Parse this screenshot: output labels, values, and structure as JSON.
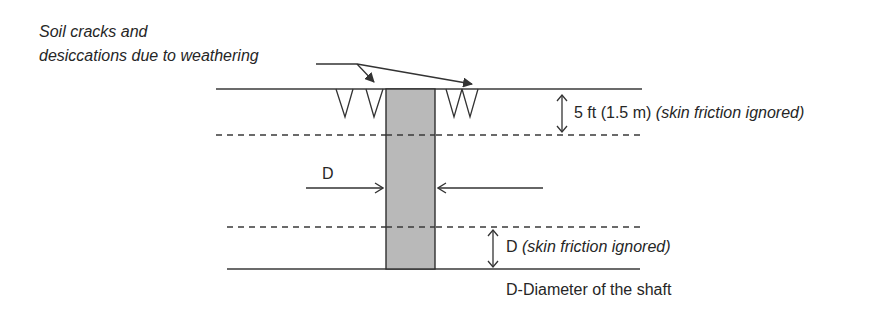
{
  "diagram": {
    "callout": {
      "line1": "Soil cracks and",
      "line2": "desiccations due to weathering"
    },
    "top_zone": {
      "dimension": "5 ft (1.5 m)",
      "note": "(skin friction ignored)"
    },
    "shaft_width_label": "D",
    "bottom_zone": {
      "dimension": "D",
      "note": "(skin friction ignored)"
    },
    "legend": "D-Diameter of the shaft",
    "colors": {
      "line": "#3a3a3a",
      "shaft_fill": "#b9b9b9",
      "shaft_edge": "#2f2f2f"
    }
  }
}
